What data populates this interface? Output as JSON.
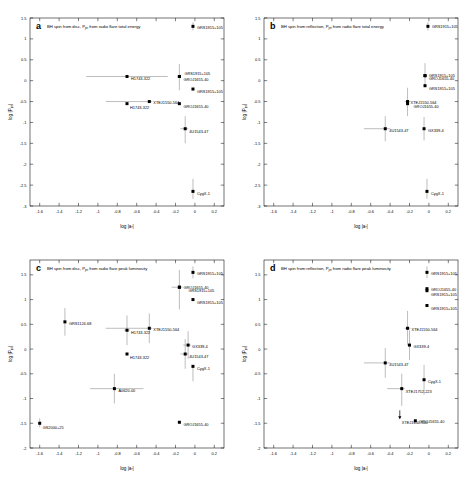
{
  "figure": {
    "axis_labels": {
      "x": "log |a",
      "x_sub": "*",
      "x_tail": "|",
      "y": "log |P",
      "y_sub": "jet",
      "y_tail": "|"
    }
  },
  "chart_data": [
    {
      "type": "scatter",
      "panel": "a",
      "title": "BH spin from disc, P_jet from radio flare total energy",
      "title_pre": "BH spin from disc, P",
      "title_sub": "jet",
      "title_post": " from radio flare total energy",
      "xlabel": "log |a*|",
      "ylabel": "log |Pjet|",
      "xlim": [
        -1.7,
        0.3
      ],
      "ylim": [
        -3.0,
        1.5
      ],
      "xticks": [
        -1.6,
        -1.4,
        -1.2,
        -1,
        -0.8,
        -0.6,
        -0.4,
        -0.2,
        0,
        0.2
      ],
      "xticklabels": [
        "-1.6",
        "-1.4",
        "-1.2",
        "-1",
        "-0.8",
        "-0.6",
        "-0.4",
        "-0.2",
        "0",
        "0.2"
      ],
      "yticks": [
        1.5,
        1,
        0.5,
        0,
        -0.5,
        -1,
        -1.5,
        -2,
        -2.5,
        -3
      ],
      "yticklabels": [
        "1.5",
        "1",
        "0.5",
        "0",
        "-0.5",
        "-1",
        "-1.5",
        "-2",
        "-2.5",
        "-3"
      ],
      "grid": false,
      "points": [
        {
          "label": "GRS1915+105",
          "x": -0.02,
          "y": 1.3,
          "xerr_lo": 0.0,
          "xerr_hi": 0.0,
          "yerr_lo": 0.1,
          "yerr_hi": 0.1,
          "label_dx": 4,
          "label_dy": 2.5
        },
        {
          "label": "H1743-322",
          "x": -0.7,
          "y": 0.1,
          "xerr_lo": 0.42,
          "xerr_hi": 0.42,
          "yerr_lo": 0.02,
          "yerr_hi": 0.02,
          "label_dx": 4,
          "label_dy": 3.5
        },
        {
          "label": "GRS1915+105",
          "x": -0.16,
          "y": 0.1,
          "xerr_lo": 0.0,
          "xerr_hi": 0.0,
          "yerr_lo": 0.33,
          "yerr_hi": 0.3,
          "label_dx": 5,
          "label_dy": -1.5
        },
        {
          "label": "GROJ1655-40",
          "x": -0.16,
          "y": 0.1,
          "xerr_lo": 0.0,
          "xerr_hi": 0.0,
          "yerr_lo": 0.0,
          "yerr_hi": 0.0,
          "label_dx": 4,
          "label_dy": 4.5
        },
        {
          "label": "GRS1915+105",
          "x": -0.02,
          "y": -0.2,
          "xerr_lo": 0.0,
          "xerr_hi": 0.0,
          "yerr_lo": 0.02,
          "yerr_hi": 0.02,
          "label_dx": 4,
          "label_dy": 4.0
        },
        {
          "label": "XTEJ1550-564",
          "x": -0.47,
          "y": -0.5,
          "xerr_lo": 0.45,
          "xerr_hi": 0.03,
          "yerr_lo": 0.02,
          "yerr_hi": 0.02,
          "label_dx": 4,
          "label_dy": 2.0
        },
        {
          "label": "H1743-322",
          "x": -0.7,
          "y": -0.55,
          "xerr_lo": 0.0,
          "xerr_hi": 0.0,
          "yerr_lo": 0.0,
          "yerr_hi": 0.0,
          "label_dx": 3,
          "label_dy": 5.0
        },
        {
          "label": "GROJ1655-40",
          "x": -0.16,
          "y": -0.55,
          "xerr_lo": 0.0,
          "xerr_hi": 0.0,
          "yerr_lo": 0.0,
          "yerr_hi": 0.0,
          "label_dx": 4,
          "label_dy": 4.5
        },
        {
          "label": "4U1543-47",
          "x": -0.1,
          "y": -1.15,
          "xerr_lo": 0.05,
          "xerr_hi": 0.03,
          "yerr_lo": 0.35,
          "yerr_hi": 0.3,
          "label_dx": 4,
          "label_dy": 4.0
        },
        {
          "label": "CygX-1",
          "x": -0.02,
          "y": -2.65,
          "xerr_lo": 0.0,
          "xerr_hi": 0.0,
          "yerr_lo": 0.18,
          "yerr_hi": 0.3,
          "label_dx": 4,
          "label_dy": 3.5
        }
      ]
    },
    {
      "type": "scatter",
      "panel": "b",
      "title": "BH spin from reflection, P_jet from radio flare total energy",
      "title_pre": "BH spin from reflection, P",
      "title_sub": "jet",
      "title_post": " from radio flare total energy",
      "xlabel": "log |a*|",
      "ylabel": "log |Pjet|",
      "xlim": [
        -1.7,
        0.3
      ],
      "ylim": [
        -3.0,
        1.5
      ],
      "xticks": [
        -1.6,
        -1.4,
        -1.2,
        -1,
        -0.8,
        -0.6,
        -0.4,
        -0.2,
        0,
        0.2
      ],
      "xticklabels": [
        "-1.6",
        "-1.4",
        "-1.2",
        "-1",
        "-0.8",
        "-0.6",
        "-0.4",
        "-0.2",
        "0",
        "0.2"
      ],
      "yticks": [
        1.5,
        1,
        0.5,
        0,
        -0.5,
        -1,
        -1.5,
        -2,
        -2.5,
        -3
      ],
      "yticklabels": [
        "1.5",
        "1",
        "0.5",
        "0",
        "-0.5",
        "-1",
        "-1.5",
        "-2",
        "-2.5",
        "-3"
      ],
      "grid": false,
      "points": [
        {
          "label": "GRS1915+105",
          "x": -0.01,
          "y": 1.3,
          "xerr_lo": 0.0,
          "xerr_hi": 0.0,
          "yerr_lo": 0.1,
          "yerr_hi": 0.1,
          "label_dx": 4,
          "label_dy": 2.0
        },
        {
          "label": "GRS1915+105",
          "x": -0.04,
          "y": 0.12,
          "xerr_lo": 0.0,
          "xerr_hi": 0.0,
          "yerr_lo": 0.28,
          "yerr_hi": 0.3,
          "label_dx": 4,
          "label_dy": 1.0
        },
        {
          "label": "GROJ1655-40",
          "x": -0.04,
          "y": 0.12,
          "xerr_lo": 0.0,
          "xerr_hi": 0.0,
          "yerr_lo": 0.0,
          "yerr_hi": 0.0,
          "label_dx": 4,
          "label_dy": 4.5
        },
        {
          "label": "GRS1915+105",
          "x": -0.04,
          "y": -0.12,
          "xerr_lo": 0.0,
          "xerr_hi": 0.0,
          "yerr_lo": 0.02,
          "yerr_hi": 0.02,
          "label_dx": 4,
          "label_dy": 4.0
        },
        {
          "label": "XTEJ1550-564",
          "x": -0.22,
          "y": -0.5,
          "xerr_lo": 0.03,
          "xerr_hi": 0.03,
          "yerr_lo": 0.35,
          "yerr_hi": 0.33,
          "label_dx": 3,
          "label_dy": 2.5
        },
        {
          "label": "GROJ1655-40",
          "x": -0.22,
          "y": -0.55,
          "xerr_lo": 0.0,
          "xerr_hi": 0.0,
          "yerr_lo": 0.0,
          "yerr_hi": 0.0,
          "label_dx": 6,
          "label_dy": 4.5
        },
        {
          "label": "4U1543-47",
          "x": -0.45,
          "y": -1.15,
          "xerr_lo": 0.22,
          "xerr_hi": 0.05,
          "yerr_lo": 0.3,
          "yerr_hi": 0.3,
          "label_dx": 4,
          "label_dy": 3.5
        },
        {
          "label": "GX339-4",
          "x": -0.05,
          "y": -1.15,
          "xerr_lo": 0.0,
          "xerr_hi": 0.0,
          "yerr_lo": 0.28,
          "yerr_hi": 0.28,
          "label_dx": 4,
          "label_dy": 3.0
        },
        {
          "label": "CygX-1",
          "x": -0.02,
          "y": -2.65,
          "xerr_lo": 0.0,
          "xerr_hi": 0.0,
          "yerr_lo": 0.18,
          "yerr_hi": 0.3,
          "label_dx": 4,
          "label_dy": 3.5
        }
      ]
    },
    {
      "type": "scatter",
      "panel": "c",
      "title": "BH spin from disc, P_jet from radio flare peak luminosity",
      "title_pre": "BH spin from disc, P",
      "title_sub": "jet",
      "title_post": " from radio flare peak luminosity",
      "xlabel": "log |a*|",
      "ylabel": "log |Pjet|",
      "xlim": [
        -1.7,
        0.3
      ],
      "ylim": [
        -2.0,
        1.8
      ],
      "xticks": [
        -1.6,
        -1.4,
        -1.2,
        -1,
        -0.8,
        -0.6,
        -0.4,
        -0.2,
        0,
        0.2
      ],
      "xticklabels": [
        "-1.6",
        "-1.4",
        "-1.2",
        "-1",
        "-0.8",
        "-0.6",
        "-0.4",
        "-0.2",
        "0",
        "0.2"
      ],
      "yticks": [
        1.5,
        1,
        0.5,
        0,
        -0.5,
        -1,
        -1.5,
        -2
      ],
      "yticklabels": [
        "1.5",
        "1",
        "0.5",
        "0",
        "-0.5",
        "-1",
        "-1.5",
        "-2"
      ],
      "grid": false,
      "points": [
        {
          "label": "GRS1915+105",
          "x": -0.02,
          "y": 1.55,
          "xerr_lo": 0.0,
          "xerr_hi": 0.0,
          "yerr_lo": 0.12,
          "yerr_hi": 0.12,
          "label_dx": 4,
          "label_dy": 2.5
        },
        {
          "label": "GRS1915+105",
          "x": -0.16,
          "y": 1.25,
          "xerr_lo": 0.08,
          "xerr_hi": 0.03,
          "yerr_lo": 0.45,
          "yerr_hi": 0.35,
          "label_dx": 9,
          "label_dy": 4.5
        },
        {
          "label": "GROJ1655-40",
          "x": -0.16,
          "y": 1.25,
          "xerr_lo": 0.0,
          "xerr_hi": 0.0,
          "yerr_lo": 0.0,
          "yerr_hi": 0.0,
          "label_dx": 4,
          "label_dy": 2.0
        },
        {
          "label": "GRS1915+105",
          "x": -0.02,
          "y": 1.0,
          "xerr_lo": 0.0,
          "xerr_hi": 0.0,
          "yerr_lo": 0.02,
          "yerr_hi": 0.02,
          "label_dx": 4,
          "label_dy": 4.0
        },
        {
          "label": "GRS1124-68",
          "x": -1.34,
          "y": 0.55,
          "xerr_lo": 0.0,
          "xerr_hi": 0.0,
          "yerr_lo": 0.28,
          "yerr_hi": 0.28,
          "label_dx": 4,
          "label_dy": 3.0
        },
        {
          "label": "XTEJ1550-564",
          "x": -0.47,
          "y": 0.42,
          "xerr_lo": 0.45,
          "xerr_hi": 0.03,
          "yerr_lo": 0.3,
          "yerr_hi": 0.3,
          "label_dx": 4,
          "label_dy": 2.5
        },
        {
          "label": "H1743-322",
          "x": -0.7,
          "y": 0.38,
          "xerr_lo": 0.03,
          "xerr_hi": 0.03,
          "yerr_lo": 0.3,
          "yerr_hi": 0.3,
          "label_dx": 4,
          "label_dy": 4.0
        },
        {
          "label": "GX339-4",
          "x": -0.07,
          "y": 0.08,
          "xerr_lo": 0.05,
          "xerr_hi": 0.03,
          "yerr_lo": 0.28,
          "yerr_hi": 0.28,
          "label_dx": 4,
          "label_dy": 3.0
        },
        {
          "label": "H1743-322",
          "x": -0.7,
          "y": -0.1,
          "xerr_lo": 0.0,
          "xerr_hi": 0.0,
          "yerr_lo": 0.0,
          "yerr_hi": 0.0,
          "label_dx": 3,
          "label_dy": 4.5
        },
        {
          "label": "4U1543-47",
          "x": -0.1,
          "y": -0.1,
          "xerr_lo": 0.05,
          "xerr_hi": 0.03,
          "yerr_lo": 0.3,
          "yerr_hi": 0.3,
          "label_dx": 4,
          "label_dy": 4.0
        },
        {
          "label": "CygX-1",
          "x": -0.02,
          "y": -0.35,
          "xerr_lo": 0.0,
          "xerr_hi": 0.0,
          "yerr_lo": 0.3,
          "yerr_hi": 0.02,
          "label_dx": 4,
          "label_dy": 3.5
        },
        {
          "label": "A0620-00",
          "x": -0.83,
          "y": -0.8,
          "xerr_lo": 0.25,
          "xerr_hi": 0.3,
          "yerr_lo": 0.3,
          "yerr_hi": 0.3,
          "label_dx": 4,
          "label_dy": 3.5
        },
        {
          "label": "GS2000+25",
          "x": -1.6,
          "y": -1.5,
          "xerr_lo": 0.0,
          "xerr_hi": 0.0,
          "yerr_lo": 0.08,
          "yerr_hi": 0.1,
          "label_dx": 3,
          "label_dy": 5.5
        },
        {
          "label": "GROJ1655-40",
          "x": -0.16,
          "y": -1.48,
          "xerr_lo": 0.0,
          "xerr_hi": 0.0,
          "yerr_lo": 0.0,
          "yerr_hi": 0.0,
          "label_dx": 4,
          "label_dy": 4.0
        }
      ]
    },
    {
      "type": "scatter",
      "panel": "d",
      "title": "BH spin from reflection, P_jet from radio flare peak luminosity",
      "title_pre": "BH spin from reflection, P",
      "title_sub": "jet",
      "title_post": " from radio flare peak luminosity",
      "xlabel": "log |a*|",
      "ylabel": "log |Pjet|",
      "xlim": [
        -1.7,
        0.3
      ],
      "ylim": [
        -2.0,
        1.8
      ],
      "xticks": [
        -1.6,
        -1.4,
        -1.2,
        -1,
        -0.8,
        -0.6,
        -0.4,
        -0.2,
        0,
        0.2
      ],
      "xticklabels": [
        "-1.6",
        "-1.4",
        "-1.2",
        "-1",
        "-0.8",
        "-0.6",
        "-0.4",
        "-0.2",
        "0",
        "0.2"
      ],
      "yticks": [
        1.5,
        1,
        0.5,
        0,
        -0.5,
        -1,
        -1.5,
        -2
      ],
      "yticklabels": [
        "1.5",
        "1",
        "0.5",
        "0",
        "-0.5",
        "-1",
        "-1.5",
        "-2"
      ],
      "grid": false,
      "points": [
        {
          "label": "GRS1915+105",
          "x": -0.02,
          "y": 1.55,
          "xerr_lo": 0.0,
          "xerr_hi": 0.0,
          "yerr_lo": 0.12,
          "yerr_hi": 0.12,
          "label_dx": 4,
          "label_dy": 3.0
        },
        {
          "label": "GROJ1655-40",
          "x": -0.02,
          "y": 1.22,
          "xerr_lo": 0.0,
          "xerr_hi": 0.0,
          "yerr_lo": 0.02,
          "yerr_hi": 0.02,
          "label_dx": 4,
          "label_dy": 2.5
        },
        {
          "label": "GRS1915+105",
          "x": -0.02,
          "y": 1.18,
          "xerr_lo": 0.0,
          "xerr_hi": 0.0,
          "yerr_lo": 0.0,
          "yerr_hi": 0.0,
          "label_dx": 4,
          "label_dy": 5.0
        },
        {
          "label": "GRS1915+105",
          "x": -0.02,
          "y": 0.88,
          "xerr_lo": 0.0,
          "xerr_hi": 0.0,
          "yerr_lo": 0.02,
          "yerr_hi": 0.02,
          "label_dx": 4,
          "label_dy": 4.5
        },
        {
          "label": "XTEJ1550-564",
          "x": -0.22,
          "y": 0.42,
          "xerr_lo": 0.03,
          "xerr_hi": 0.03,
          "yerr_lo": 0.35,
          "yerr_hi": 0.35,
          "label_dx": 4,
          "label_dy": 3.0
        },
        {
          "label": "GX339-4",
          "x": -0.2,
          "y": 0.08,
          "xerr_lo": 0.0,
          "xerr_hi": 0.0,
          "yerr_lo": 0.3,
          "yerr_hi": 0.3,
          "label_dx": 4,
          "label_dy": 3.0
        },
        {
          "label": "4U1543-47",
          "x": -0.45,
          "y": -0.28,
          "xerr_lo": 0.22,
          "xerr_hi": 0.05,
          "yerr_lo": 0.3,
          "yerr_hi": 0.3,
          "label_dx": 4,
          "label_dy": 3.5
        },
        {
          "label": "CygX-1",
          "x": -0.05,
          "y": -0.62,
          "xerr_lo": 0.0,
          "xerr_hi": 0.0,
          "yerr_lo": 0.3,
          "yerr_hi": 0.3,
          "label_dx": 4,
          "label_dy": 3.5
        },
        {
          "label": "XTEJ1752-223",
          "x": -0.28,
          "y": -0.8,
          "xerr_lo": 0.15,
          "xerr_hi": 0.03,
          "yerr_lo": 0.35,
          "yerr_hi": 0.3,
          "label_dx": 4,
          "label_dy": 4.0
        },
        {
          "label": "XTEJ1650-500",
          "x": -0.3,
          "y": -1.42,
          "xerr_lo": 0.0,
          "xerr_hi": 0.0,
          "yerr_lo": 0.0,
          "yerr_hi": 0.0,
          "arrow": "down",
          "label_dx": 2,
          "label_dy": 4.5
        },
        {
          "label": "GROJ1655-40",
          "x": -0.14,
          "y": -1.45,
          "xerr_lo": 0.0,
          "xerr_hi": 0.0,
          "yerr_lo": 0.0,
          "yerr_hi": 0.0,
          "label_dx": 4,
          "label_dy": 2.0
        }
      ]
    }
  ]
}
